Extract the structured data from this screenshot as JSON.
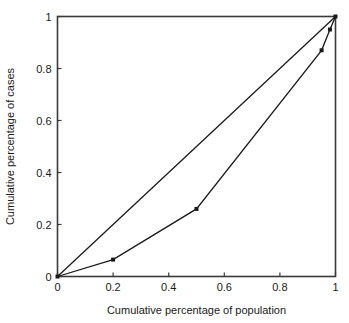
{
  "chart_data": {
    "type": "line",
    "title": "",
    "subtitle": "",
    "xlabel": "Cumulative percentage of population",
    "ylabel": "Cumulative percentage of cases",
    "xlim": [
      0,
      1
    ],
    "ylim": [
      0,
      1
    ],
    "grid": false,
    "legend": null,
    "x_ticks": [
      0,
      0.2,
      0.4,
      0.6,
      0.8,
      1
    ],
    "x_tick_labels": [
      "0",
      "0.2",
      "0.4",
      "0.6",
      "0.8",
      "1"
    ],
    "y_ticks": [
      0,
      0.2,
      0.4,
      0.6,
      0.8,
      1
    ],
    "y_tick_labels": [
      "0",
      "0.2",
      "0.4",
      "0.6",
      "0.8",
      "1"
    ],
    "series": [
      {
        "name": "line-of-equality",
        "marker": "none",
        "color": "#1a1a1a",
        "x": [
          0,
          1
        ],
        "y": [
          0,
          1
        ]
      },
      {
        "name": "lorenz-curve",
        "marker": "square",
        "color": "#1a1a1a",
        "x": [
          0,
          0.2,
          0.5,
          0.95,
          0.98,
          1
        ],
        "y": [
          0,
          0.065,
          0.26,
          0.87,
          0.95,
          1
        ]
      }
    ],
    "annotations": []
  },
  "colors": {
    "axis": "#3a3a3a",
    "line": "#1a1a1a",
    "text": "#1a1a1a",
    "background": "#ffffff"
  }
}
